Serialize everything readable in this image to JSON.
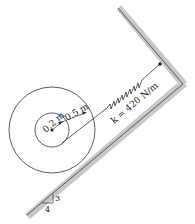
{
  "diagram": {
    "type": "spool-on-incline-with-spring",
    "inner_radius_label": "0.2 m",
    "outer_radius_label": "0.5 m",
    "spring_label": "k = 420 N/m",
    "slope": {
      "rise": "3",
      "run": "4"
    },
    "colors": {
      "wall_fill": "#c8c8c8",
      "line": "#333333",
      "background": "#ffffff"
    }
  }
}
